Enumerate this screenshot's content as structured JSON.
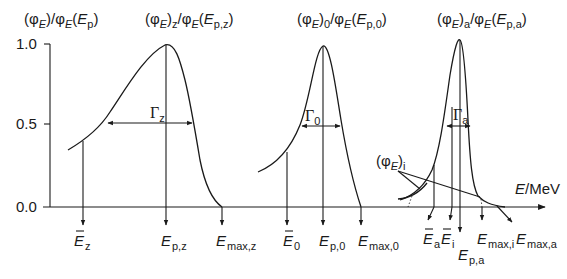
{
  "figure": {
    "y_axis_label": {
      "open": "(φ",
      "sub_E": "E",
      "mid": ")/φ",
      "sub_E2": "E",
      "paren": "(",
      "E": "E",
      "sub": "p",
      "close": ")"
    },
    "y_ticks": [
      "1.0",
      "0.5",
      "0.0"
    ],
    "x_axis_label": {
      "E": "E",
      "unit": "/MeV"
    },
    "peaks": [
      {
        "id": "z",
        "title": {
          "pre": "(φ",
          "subE": "E",
          "close": ")",
          "sub": "z",
          "slash": "/φ",
          "subE2": "E",
          "paren": "(",
          "E": "E",
          "psub": "p,z",
          "end": ")"
        },
        "gamma": "Γ",
        "gamma_sub": "z"
      },
      {
        "id": "0",
        "title": {
          "pre": "(φ",
          "subE": "E",
          "close": ")",
          "sub": "0",
          "slash": "/φ",
          "subE2": "E",
          "paren": "(",
          "E": "E",
          "psub": "p,0",
          "end": ")"
        },
        "gamma": "Γ",
        "gamma_sub": "0"
      },
      {
        "id": "a",
        "title": {
          "pre": "(φ",
          "subE": "E",
          "close": ")",
          "sub": "a",
          "slash": "/φ",
          "subE2": "E",
          "paren": "(",
          "E": "E",
          "psub": "p,a",
          "end": ")"
        },
        "gamma": "Γ",
        "gamma_sub": "a"
      }
    ],
    "phi_i_label": {
      "pre": "(φ",
      "subE": "E",
      "close": ")",
      "sub": "i"
    },
    "x_markers": [
      {
        "E": "E",
        "bar": true,
        "sub": "z"
      },
      {
        "E": "E",
        "bar": false,
        "sub": "p,z"
      },
      {
        "E": "E",
        "bar": false,
        "sub": "max,z"
      },
      {
        "E": "E",
        "bar": true,
        "sub": "0"
      },
      {
        "E": "E",
        "bar": false,
        "sub": "p,0"
      },
      {
        "E": "E",
        "bar": false,
        "sub": "max,0"
      },
      {
        "E": "E",
        "bar": true,
        "sub": "a"
      },
      {
        "E": "E",
        "bar": true,
        "sub": "i"
      },
      {
        "E": "E",
        "bar": false,
        "sub": "p,a"
      },
      {
        "E": "E",
        "bar": false,
        "sub": "max,i"
      },
      {
        "E": "E",
        "bar": false,
        "sub": "max,a"
      }
    ]
  }
}
